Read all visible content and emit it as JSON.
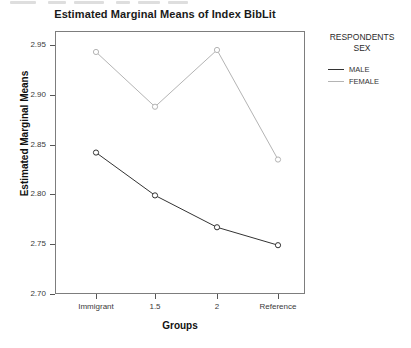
{
  "chart_data": {
    "type": "line",
    "title": "Estimated Marginal Means of Index BibLit",
    "xlabel": "Groups",
    "ylabel": "Estimated Marginal Means",
    "categories": [
      "Immigrant",
      "1.5",
      "2",
      "Reference"
    ],
    "ylim": [
      2.7,
      2.95
    ],
    "yticks": [
      "2.95",
      "2.90",
      "2.85",
      "2.80",
      "2.75",
      "2.70"
    ],
    "ytick_values": [
      2.95,
      2.9,
      2.85,
      2.8,
      2.75,
      2.7
    ],
    "grid": false,
    "legend_position": "right",
    "legend_title": "RESPONDENTS SEX",
    "series": [
      {
        "name": "MALE",
        "color": "#333333",
        "values": [
          2.842,
          2.799,
          2.767,
          2.749
        ]
      },
      {
        "name": "FEMALE",
        "color": "#b4b4b4",
        "values": [
          2.943,
          2.888,
          2.945,
          2.835
        ]
      }
    ]
  },
  "legend": {
    "title_line1": "RESPONDENTS",
    "title_line2": "SEX",
    "items": [
      {
        "label": "MALE",
        "color": "#333333"
      },
      {
        "label": "FEMALE",
        "color": "#b4b4b4"
      }
    ]
  },
  "colors": {
    "male": "#333333",
    "female": "#b4b4b4",
    "axis": "#7d7d7d",
    "text": "#1a1a1a"
  }
}
